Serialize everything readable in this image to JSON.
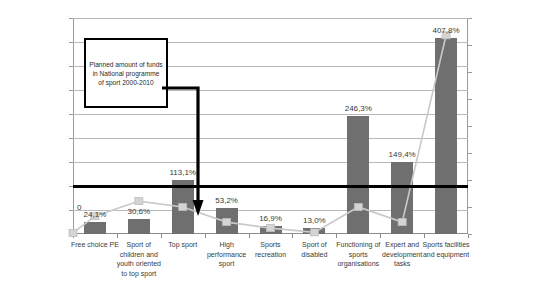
{
  "chart_data": {
    "type": "bar",
    "title": "",
    "subtitle": "",
    "xlabel": "",
    "ylabel": "",
    "grid": true,
    "legend": "none",
    "categories": [
      "Free choice PE",
      "Sport of children and youth oriented to top sport",
      "Top sport",
      "High performance sport",
      "Sports recreation",
      "Sport of disabled",
      "Functioning of sports organisations",
      "Expert and development tasks",
      "Sports facilities and equipment"
    ],
    "series": [
      {
        "name": "percentage-bars",
        "axis": "left",
        "type": "bar",
        "color": "#6f6f6f",
        "values": [
          24.1,
          30.6,
          113.1,
          53.2,
          16.9,
          13.0,
          246.3,
          149.4,
          407.8
        ],
        "labels": [
          "24,1%",
          "30,6%",
          "113,1%",
          "53,2%",
          "16,9%",
          "13,0%",
          "246,3%",
          "149,4%",
          "407,8%"
        ]
      },
      {
        "name": "planned-amount-line",
        "axis": "right",
        "type": "line",
        "color": "#c9c9c9",
        "marker": "square",
        "values": [
          33000000,
          61000000,
          50000000,
          22000000,
          11000000,
          3000000,
          50000000,
          22000000,
          368000000
        ],
        "origin_value": 2000000,
        "origin_label": "0"
      }
    ],
    "left_axis": {
      "ticks": [
        "0%",
        "50 %",
        "100 %",
        "150 %",
        "200 %",
        "250 %",
        "300 %",
        "350 %",
        "400 %",
        "450 %"
      ],
      "min": 0,
      "max": 450,
      "step": 50,
      "unit": "%"
    },
    "right_axis": {
      "ticks": [
        ",0",
        "50000000,0",
        "100000000,0",
        "150000000,0",
        "200000000,0",
        "250000000,0",
        "300000000,0",
        "350000000,0",
        "400000000,0"
      ],
      "min": 0,
      "max": 400000000,
      "step": 50000000
    },
    "reference_line": {
      "value": 100,
      "axis": "left",
      "color": "#000000",
      "label": ""
    },
    "annotation": {
      "text": "Planned amount of funds in National programme of sport 2000-2010",
      "points_to": "Top sport"
    }
  },
  "colors": {
    "bar": "#6f6f6f",
    "line": "#c9c9c9",
    "grid": "#b9b9b9",
    "reference": "#000000",
    "background": "#ffffff",
    "text": "#3a3a3a"
  }
}
